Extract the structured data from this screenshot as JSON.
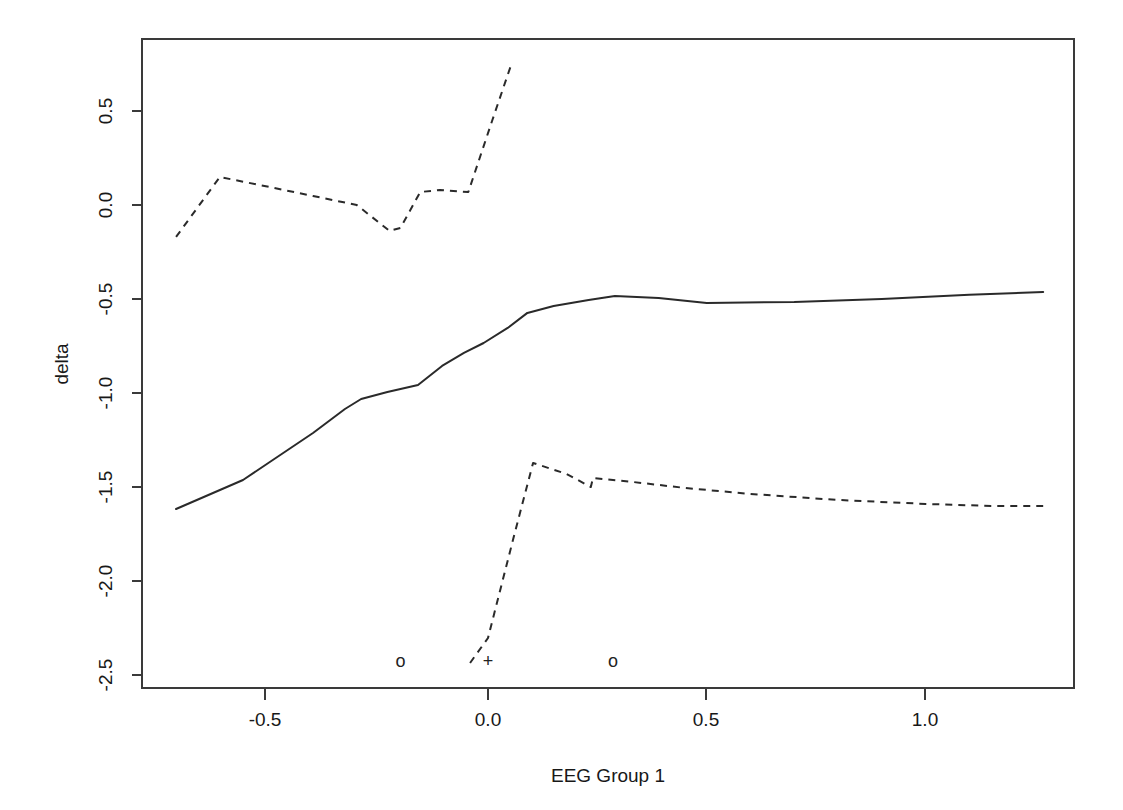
{
  "chart_data": {
    "type": "line",
    "title": "",
    "xlabel": "EEG Group 1",
    "ylabel": "delta",
    "xlim": [
      -0.79,
      1.34
    ],
    "ylim": [
      -2.59,
      0.85
    ],
    "grid": false,
    "legend": "none",
    "xticks": [
      -0.5,
      0.0,
      0.5,
      1.0
    ],
    "xticklabels": [
      "-0.5",
      "0.0",
      "0.5",
      "1.0"
    ],
    "yticks": [
      0.5,
      0.0,
      -0.5,
      -1.0,
      -1.5,
      -2.0,
      -2.5
    ],
    "yticklabels": [
      "0.5",
      "0.0",
      "-0.5",
      "-1.0",
      "-1.5",
      "-2.0",
      "-2.5"
    ],
    "series": [
      {
        "name": "estimate",
        "style": "solid",
        "x": [
          -0.713,
          -0.56,
          -0.4,
          -0.327,
          -0.29,
          -0.23,
          -0.16,
          -0.105,
          -0.055,
          -0.01,
          0.045,
          0.09,
          0.15,
          0.23,
          0.29,
          0.39,
          0.5,
          0.7,
          0.9,
          1.1,
          1.269
        ],
        "y": [
          -1.617,
          -1.463,
          -1.213,
          -1.085,
          -1.032,
          -0.995,
          -0.957,
          -0.856,
          -0.787,
          -0.734,
          -0.654,
          -0.574,
          -0.537,
          -0.505,
          -0.484,
          -0.495,
          -0.521,
          -0.516,
          -0.5,
          -0.478,
          -0.463
        ]
      },
      {
        "name": "upper-confidence-band",
        "style": "dashed",
        "x": [
          -0.713,
          -0.613,
          -0.5,
          -0.4,
          -0.3,
          -0.225,
          -0.2,
          -0.155,
          -0.11,
          -0.045,
          0.01,
          0.055
        ],
        "y": [
          -0.17,
          0.149,
          0.096,
          0.048,
          0.0,
          -0.138,
          -0.122,
          0.069,
          0.08,
          0.069,
          0.452,
          0.76
        ]
      },
      {
        "name": "lower-confidence-band",
        "style": "dashed",
        "x": [
          -0.041,
          0.0,
          0.06,
          0.103,
          0.18,
          0.235,
          0.24,
          0.33,
          0.45,
          0.6,
          0.8,
          1.0,
          1.15,
          1.269
        ],
        "y": [
          -2.436,
          -2.303,
          -1.755,
          -1.372,
          -1.431,
          -1.5,
          -1.452,
          -1.473,
          -1.505,
          -1.537,
          -1.569,
          -1.59,
          -1.601,
          -1.601
        ]
      }
    ],
    "rug_marks": [
      {
        "glyph": "o",
        "x": -0.2,
        "y": -2.426,
        "name": "rug-circle-left"
      },
      {
        "glyph": "+",
        "x": 0.0,
        "y": -2.426,
        "name": "rug-plus-center"
      },
      {
        "glyph": "o",
        "x": 0.286,
        "y": -2.426,
        "name": "rug-circle-right"
      }
    ],
    "colors": {
      "line": "#2a2a2a",
      "frame": "#3a3a3a",
      "background": "#ffffff",
      "text": "#181818"
    }
  }
}
